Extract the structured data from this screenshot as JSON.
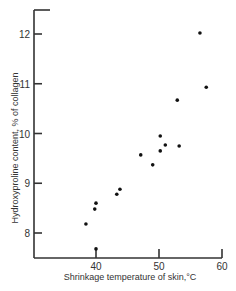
{
  "chart_data": {
    "type": "scatter",
    "title": "",
    "xlabel": "Shrinkage temperature of skin,°C",
    "ylabel": "Hydroxyproline content, % of collagen",
    "xlim": [
      30,
      60
    ],
    "ylim": [
      7.5,
      12.5
    ],
    "xticks": [
      40,
      50,
      60
    ],
    "yticks": [
      8,
      9,
      10,
      11,
      12
    ],
    "grid": false,
    "points": [
      {
        "x": 38.4,
        "y": 8.18
      },
      {
        "x": 39.8,
        "y": 8.48
      },
      {
        "x": 40.0,
        "y": 8.6
      },
      {
        "x": 40.0,
        "y": 7.68
      },
      {
        "x": 43.3,
        "y": 8.78
      },
      {
        "x": 43.8,
        "y": 8.88
      },
      {
        "x": 47.1,
        "y": 9.57
      },
      {
        "x": 49.0,
        "y": 9.37
      },
      {
        "x": 50.2,
        "y": 9.95
      },
      {
        "x": 50.2,
        "y": 9.65
      },
      {
        "x": 51.0,
        "y": 9.77
      },
      {
        "x": 53.2,
        "y": 9.75
      },
      {
        "x": 52.9,
        "y": 10.67
      },
      {
        "x": 57.5,
        "y": 10.93
      },
      {
        "x": 56.5,
        "y": 12.02
      }
    ]
  }
}
